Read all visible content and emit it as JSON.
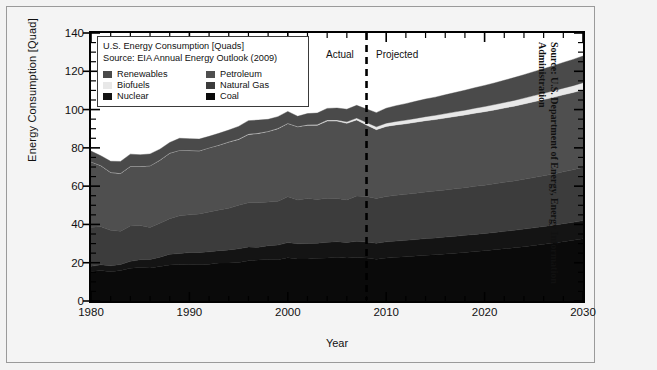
{
  "figure": {
    "outer_source_note": "Source: U.S. Department of Energy, Energy Information Administration",
    "source_line1": "Source: U.S. Department of Energy, Energy Information",
    "source_line2": "Administration"
  },
  "legend": {
    "title_line1": "U.S. Energy Consumption [Quads]",
    "title_line2": "Source: EIA Annual Energy Outlook (2009)",
    "entries": [
      {
        "label": "Renewables",
        "color": "#4a4a4a"
      },
      {
        "label": "Petroleum",
        "color": "#4f4f4f"
      },
      {
        "label": "Biofuels",
        "color": "#e8e8e8"
      },
      {
        "label": "Natural Gas",
        "color": "#3c3c3c"
      },
      {
        "label": "Nuclear",
        "color": "#141414"
      },
      {
        "label": "Coal",
        "color": "#0a0a0a"
      }
    ]
  },
  "annotations": {
    "actual": "Actual",
    "projected": "Projected",
    "divider_year": 2008
  },
  "chart_data": {
    "type": "area",
    "title": "U.S. Energy Consumption [Quads]",
    "subtitle": "Source: EIA Annual Energy Outlook (2009)",
    "xlabel": "Year",
    "ylabel": "Energy Consumption [Quad]",
    "xlim": [
      1980,
      2030
    ],
    "ylim": [
      0,
      140
    ],
    "xticks": [
      1980,
      1990,
      2000,
      2010,
      2020,
      2030
    ],
    "yticks": [
      0,
      20,
      40,
      60,
      80,
      100,
      120,
      140
    ],
    "x_minor_step": 2,
    "y_minor_step": 5,
    "grid": false,
    "legend_position": "upper-left-inside",
    "stacked": true,
    "stack_order_bottom_to_top": [
      "Coal",
      "Nuclear",
      "Natural Gas",
      "Petroleum",
      "Biofuels",
      "Renewables"
    ],
    "x": [
      1980,
      1981,
      1982,
      1983,
      1984,
      1985,
      1986,
      1987,
      1988,
      1989,
      1990,
      1991,
      1992,
      1993,
      1994,
      1995,
      1996,
      1997,
      1998,
      1999,
      2000,
      2001,
      2002,
      2003,
      2004,
      2005,
      2006,
      2007,
      2008,
      2009,
      2010,
      2011,
      2012,
      2013,
      2014,
      2015,
      2016,
      2017,
      2018,
      2019,
      2020,
      2021,
      2022,
      2023,
      2024,
      2025,
      2026,
      2027,
      2028,
      2029,
      2030
    ],
    "series": [
      {
        "name": "Coal",
        "color": "#0a0a0a",
        "values": [
          15.4,
          15.9,
          15.3,
          15.9,
          17.1,
          17.5,
          17.3,
          18.0,
          18.8,
          19.1,
          19.2,
          19.0,
          19.2,
          19.8,
          19.9,
          20.1,
          21.0,
          21.4,
          21.7,
          21.6,
          22.6,
          21.9,
          21.9,
          22.3,
          22.5,
          22.8,
          22.4,
          22.7,
          22.4,
          21.8,
          22.4,
          22.8,
          23.1,
          23.5,
          23.9,
          24.2,
          24.6,
          25.0,
          25.4,
          25.9,
          26.3,
          26.8,
          27.3,
          27.8,
          28.4,
          29.0,
          29.6,
          30.3,
          31.0,
          31.7,
          32.5
        ]
      },
      {
        "name": "Nuclear",
        "color": "#141414",
        "values": [
          2.7,
          3.0,
          3.1,
          3.2,
          3.6,
          4.1,
          4.4,
          4.9,
          5.6,
          5.7,
          6.1,
          6.4,
          6.5,
          6.5,
          6.8,
          7.2,
          7.2,
          6.7,
          7.2,
          7.6,
          7.9,
          8.0,
          8.1,
          7.9,
          8.2,
          8.2,
          8.2,
          8.5,
          8.4,
          8.4,
          8.5,
          8.5,
          8.6,
          8.6,
          8.7,
          8.7,
          8.8,
          8.8,
          8.9,
          8.9,
          9.0,
          9.0,
          9.1,
          9.1,
          9.2,
          9.2,
          9.3,
          9.3,
          9.4,
          9.4,
          9.5
        ]
      },
      {
        "name": "Natural Gas",
        "color": "#3c3c3c",
        "values": [
          20.4,
          19.9,
          18.5,
          17.4,
          18.5,
          17.8,
          16.7,
          17.7,
          18.6,
          19.7,
          19.7,
          20.1,
          20.8,
          21.3,
          21.7,
          22.7,
          23.1,
          23.2,
          22.8,
          22.9,
          23.9,
          22.8,
          23.6,
          22.8,
          23.0,
          22.6,
          22.2,
          23.6,
          23.8,
          23.4,
          23.7,
          23.9,
          24.0,
          24.2,
          24.3,
          24.5,
          24.6,
          24.8,
          24.9,
          25.1,
          25.2,
          25.4,
          25.6,
          25.8,
          26.0,
          26.3,
          26.5,
          26.8,
          27.1,
          27.4,
          27.7
        ]
      },
      {
        "name": "Petroleum",
        "color": "#4f4f4f",
        "values": [
          34.2,
          31.9,
          30.2,
          30.1,
          31.1,
          30.9,
          32.2,
          32.9,
          34.2,
          34.2,
          33.6,
          32.9,
          33.5,
          33.8,
          34.6,
          34.4,
          35.7,
          36.2,
          36.8,
          37.9,
          38.3,
          38.3,
          38.2,
          38.8,
          40.3,
          40.4,
          40.0,
          39.8,
          37.3,
          35.9,
          36.6,
          36.8,
          36.9,
          37.1,
          37.3,
          37.4,
          37.6,
          37.8,
          38.0,
          38.2,
          38.4,
          38.6,
          38.8,
          39.1,
          39.3,
          39.6,
          39.8,
          40.0,
          40.2,
          40.4,
          40.6
        ]
      },
      {
        "name": "Biofuels",
        "color": "#e8e8e8",
        "values": [
          0.1,
          0.1,
          0.1,
          0.1,
          0.1,
          0.1,
          0.1,
          0.1,
          0.1,
          0.1,
          0.1,
          0.1,
          0.1,
          0.1,
          0.2,
          0.2,
          0.2,
          0.2,
          0.2,
          0.2,
          0.2,
          0.2,
          0.3,
          0.4,
          0.5,
          0.6,
          0.8,
          1.0,
          1.4,
          1.5,
          1.7,
          1.8,
          1.9,
          2.0,
          2.1,
          2.2,
          2.3,
          2.4,
          2.5,
          2.6,
          2.7,
          2.8,
          2.9,
          3.0,
          3.1,
          3.2,
          3.3,
          3.4,
          3.5,
          3.6,
          3.7
        ]
      },
      {
        "name": "Renewables",
        "color": "#4a4a4a",
        "values": [
          5.5,
          5.1,
          5.8,
          6.2,
          6.3,
          6.0,
          6.1,
          5.7,
          5.5,
          6.2,
          6.1,
          6.1,
          5.9,
          6.1,
          6.1,
          6.6,
          7.0,
          6.8,
          6.2,
          6.1,
          6.1,
          5.3,
          5.8,
          6.0,
          6.1,
          6.2,
          6.6,
          6.6,
          7.0,
          7.4,
          7.8,
          8.2,
          8.6,
          8.9,
          9.2,
          9.5,
          9.8,
          10.1,
          10.4,
          10.7,
          11.0,
          11.3,
          11.6,
          11.9,
          12.2,
          12.5,
          12.8,
          13.1,
          13.4,
          13.7,
          14.0
        ]
      }
    ],
    "total_top_envelope": [
      78.3,
      75.9,
      73.0,
      72.9,
      76.7,
      76.4,
      76.8,
      79.3,
      82.8,
      85.0,
      84.8,
      84.6,
      86.0,
      87.6,
      89.3,
      91.2,
      94.2,
      94.5,
      94.9,
      96.3,
      99.0,
      96.5,
      97.9,
      98.2,
      100.6,
      100.8,
      100.2,
      102.2,
      100.3,
      98.4,
      100.7,
      102.0,
      103.1,
      104.3,
      105.5,
      106.5,
      107.7,
      108.9,
      110.1,
      111.4,
      112.6,
      113.9,
      115.3,
      116.7,
      118.2,
      119.8,
      121.3,
      122.9,
      124.6,
      126.2,
      128.0
    ]
  }
}
